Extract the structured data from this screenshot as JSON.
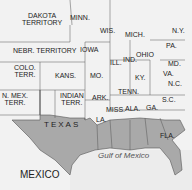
{
  "map": {
    "colors": {
      "seceded": "#a9a9a9",
      "other": "#f2f2f2",
      "water": "#e8e8e8",
      "border": "#555555"
    },
    "labels": {
      "dakota": "DAKOTA\nTERRITORY",
      "minn": "MINN.",
      "wis": "WIS.",
      "mich": "MICH.",
      "ny": "N.Y.",
      "nebr": "NEBR. TERRITORY",
      "iowa": "IOWA",
      "pa": "PA.",
      "ohio": "OHIO",
      "ill": "ILL.",
      "ind": "IND.",
      "md": "MD.",
      "colo": "COLO.\nTERR.",
      "kans": "KANS.",
      "mo": "MO.",
      "ky": "KY.",
      "va": "VA.",
      "nc": "N.C.",
      "nmex": "N. MEX.\nTERR.",
      "indian": "INDIAN\nTERR.",
      "ark": "ARK.",
      "tenn": "TENN.",
      "sc": "S.C.",
      "texas": "TEXAS",
      "la": "LA.",
      "miss": "MISS.",
      "ala": "ALA.",
      "ga": "GA.",
      "fla": "FLA.",
      "mexico": "MEXICO",
      "gulf": "Gulf of Mexico"
    }
  }
}
